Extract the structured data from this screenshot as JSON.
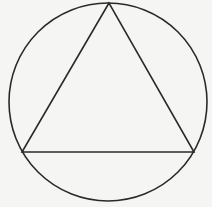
{
  "diagram": {
    "background": "#f5f5f3",
    "stroke_color": "#2a2a2a",
    "stroke_width": 1.6,
    "circle": {
      "cx": 108,
      "cy": 102,
      "r": 99
    },
    "triangle": {
      "vertices": [
        {
          "name": "top",
          "x": 109,
          "y": 3
        },
        {
          "name": "bottom-left",
          "x": 22,
          "y": 152
        },
        {
          "name": "bottom-right",
          "x": 194,
          "y": 152
        }
      ]
    }
  }
}
